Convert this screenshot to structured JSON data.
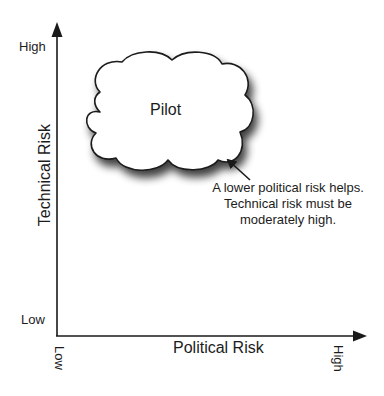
{
  "diagram": {
    "type": "2x2-risk-quadrant",
    "y_axis": {
      "title": "Technical Risk",
      "high_label": "High",
      "low_label": "Low"
    },
    "x_axis": {
      "title": "Political Risk",
      "low_label": "Low",
      "high_label": "High"
    },
    "cloud": {
      "label": "Pilot",
      "fill": "#ffffff",
      "stroke": "#1a1a1a"
    },
    "annotation": {
      "lines": [
        "A lower political risk helps.",
        "Technical risk must be",
        "moderately high."
      ]
    },
    "colors": {
      "axis": "#1a1a1a",
      "background": "#ffffff",
      "text": "#1c1c1c"
    }
  }
}
